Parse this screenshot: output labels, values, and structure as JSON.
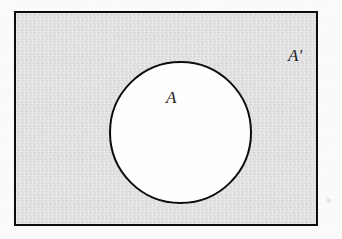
{
  "figure": {
    "kind": "venn-diagram",
    "canvas": {
      "width_px": 342,
      "height_px": 239,
      "background": "#fdfdfd"
    }
  },
  "universe": {
    "name": "universal-set-rectangle",
    "fill_color": "#e0e0e0",
    "stroke_color": "#0d0d0d",
    "stroke_width_px": 2,
    "x_px": 14,
    "y_px": 11,
    "width_px": 304,
    "height_px": 215
  },
  "set_a": {
    "name": "set-a-circle",
    "fill_color": "#fefefe",
    "stroke_color": "#0d0d0d",
    "stroke_width_px": 2,
    "center_x_px": 164,
    "center_y_px": 119,
    "diameter_px": 141
  },
  "labels": {
    "set_a": {
      "text": "A",
      "meaning": "set-a",
      "style": "italic-serif",
      "x_px": 162,
      "y_px": 87
    },
    "complement": {
      "base": "A",
      "prime": "′",
      "text": "A′",
      "meaning": "complement-of-set-a",
      "style": "italic-serif",
      "x_px": 283,
      "y_px": 45
    }
  },
  "colors": {
    "shaded_region": "#e0e0e0",
    "unshaded_region": "#fefefe",
    "outline": "#0d0d0d",
    "page": "#fdfdfd"
  }
}
